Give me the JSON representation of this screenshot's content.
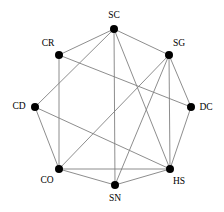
{
  "diagram": {
    "type": "undirected-network-graph",
    "title": "",
    "style": {
      "node_color": "#000000",
      "node_radius": 4,
      "edge_color": "#808080",
      "edge_width": 0.9,
      "background": "#ffffff",
      "label_color": "#000000",
      "label_font_size": 9.5
    },
    "layout": "circular",
    "node_count": 8,
    "edge_count": 17,
    "nodes": [
      {
        "id": "SC",
        "label": "SC",
        "x": 114,
        "y": 29,
        "label_x": 114,
        "label_y": 16,
        "label_anchor": "middle"
      },
      {
        "id": "SG",
        "label": "SG",
        "x": 169,
        "y": 55,
        "label_x": 179,
        "label_y": 44,
        "label_anchor": "middle"
      },
      {
        "id": "DC",
        "label": "DC",
        "x": 191,
        "y": 107,
        "label_x": 206,
        "label_y": 108,
        "label_anchor": "middle"
      },
      {
        "id": "HS",
        "label": "HS",
        "x": 170,
        "y": 169,
        "label_x": 179,
        "label_y": 182,
        "label_anchor": "middle"
      },
      {
        "id": "SN",
        "label": "SN",
        "x": 115,
        "y": 185,
        "label_x": 115,
        "label_y": 199,
        "label_anchor": "middle"
      },
      {
        "id": "CO",
        "label": "CO",
        "x": 59,
        "y": 169,
        "label_x": 47,
        "label_y": 181,
        "label_anchor": "middle"
      },
      {
        "id": "CD",
        "label": "CD",
        "x": 35,
        "y": 107,
        "label_x": 19,
        "label_y": 107,
        "label_anchor": "middle"
      },
      {
        "id": "CR",
        "label": "CR",
        "x": 59,
        "y": 55,
        "label_x": 48,
        "label_y": 44,
        "label_anchor": "middle"
      }
    ],
    "edges": [
      {
        "source": "SC",
        "target": "SG"
      },
      {
        "source": "SC",
        "target": "CR"
      },
      {
        "source": "SC",
        "target": "CD"
      },
      {
        "source": "SC",
        "target": "SN"
      },
      {
        "source": "SC",
        "target": "HS"
      },
      {
        "source": "SG",
        "target": "DC"
      },
      {
        "source": "SG",
        "target": "HS"
      },
      {
        "source": "SG",
        "target": "SN"
      },
      {
        "source": "SG",
        "target": "CO"
      },
      {
        "source": "DC",
        "target": "HS"
      },
      {
        "source": "DC",
        "target": "CR"
      },
      {
        "source": "HS",
        "target": "SN"
      },
      {
        "source": "HS",
        "target": "CO"
      },
      {
        "source": "HS",
        "target": "CD"
      },
      {
        "source": "SN",
        "target": "CO"
      },
      {
        "source": "CO",
        "target": "CD"
      },
      {
        "source": "CO",
        "target": "CR"
      }
    ]
  }
}
